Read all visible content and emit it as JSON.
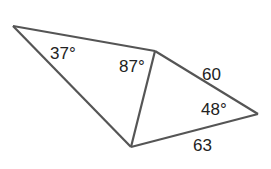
{
  "diagram": {
    "type": "geometry-figure",
    "vertices": {
      "A": [
        13,
        26
      ],
      "B": [
        155,
        51
      ],
      "C": [
        131,
        147
      ],
      "D": [
        258,
        114
      ]
    },
    "edges": [
      {
        "from": "A",
        "to": "B"
      },
      {
        "from": "A",
        "to": "C"
      },
      {
        "from": "B",
        "to": "C"
      },
      {
        "from": "B",
        "to": "D"
      },
      {
        "from": "C",
        "to": "D"
      }
    ],
    "labels": {
      "angle_A": "37°",
      "angle_ABC": "87°",
      "angle_D": "48°",
      "side_BD": "60",
      "side_CD": "63"
    },
    "color": "#555555"
  }
}
